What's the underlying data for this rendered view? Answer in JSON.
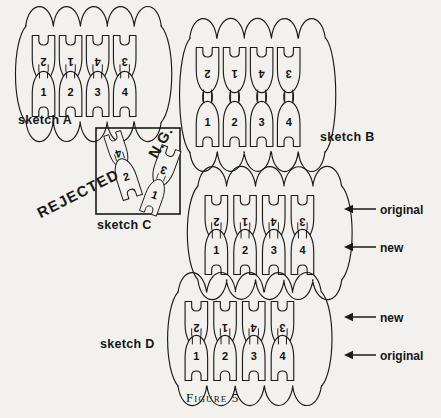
{
  "figure": {
    "caption": "Figure 5",
    "background_color": "#f3f1ed",
    "ink_color": "#1a1a1a"
  },
  "sketches": [
    {
      "id": "sketch-a",
      "label": "sketch A",
      "top_row_numbers": [
        "2",
        "1",
        "4",
        "3"
      ],
      "bottom_row_numbers": [
        "1",
        "2",
        "3",
        "4"
      ],
      "style": "interlocked-tight"
    },
    {
      "id": "sketch-b",
      "label": "sketch B",
      "top_row_numbers": [
        "2",
        "1",
        "4",
        "3"
      ],
      "bottom_row_numbers": [
        "1",
        "2",
        "3",
        "4"
      ],
      "style": "interlocked-loose"
    },
    {
      "id": "sketch-c",
      "label": "sketch C",
      "top_row_numbers": [
        "4",
        "3"
      ],
      "bottom_row_numbers": [
        "2",
        "1"
      ],
      "style": "rotated-detached",
      "stamps": {
        "rejected": "REJECTED",
        "ng": "N.G."
      }
    },
    {
      "id": "sketch-c2",
      "label": "",
      "top_row_numbers": [
        "2",
        "1",
        "4",
        "3"
      ],
      "bottom_row_numbers": [
        "1",
        "2",
        "3",
        "4"
      ],
      "style": "interlocked-tight",
      "callouts": [
        {
          "name": "top",
          "text": "original"
        },
        {
          "name": "bottom",
          "text": "new"
        }
      ]
    },
    {
      "id": "sketch-d",
      "label": "sketch D",
      "top_row_numbers": [
        "2",
        "1",
        "4",
        "3"
      ],
      "bottom_row_numbers": [
        "1",
        "2",
        "3",
        "4"
      ],
      "style": "interlocked-tight",
      "callouts": [
        {
          "name": "top",
          "text": "new"
        },
        {
          "name": "bottom",
          "text": "original"
        }
      ]
    }
  ]
}
